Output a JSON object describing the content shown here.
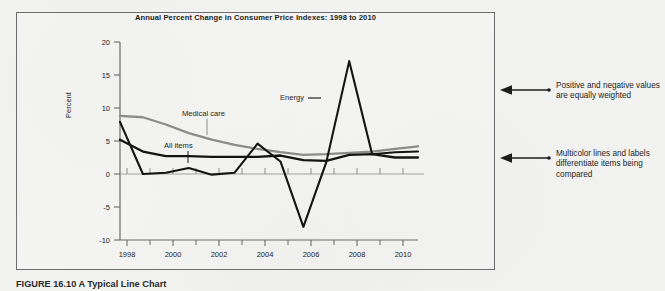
{
  "figure": {
    "caption": "FIGURE 16.10  A Typical Line Chart",
    "box_border_color": "#6e6e72",
    "background_color": "#f2f2f0"
  },
  "chart_title": "Annual Percent Change in Consumer Price Indexes: 1998 to 2010",
  "axis": {
    "y_title": "Percent",
    "y_ticks": [
      "20",
      "15",
      "10",
      "5",
      "0",
      "-5",
      "-10"
    ],
    "y_min": -10,
    "y_max": 20,
    "x_ticks": [
      "1998",
      "2000",
      "2002",
      "2004",
      "2006",
      "2008",
      "2010"
    ],
    "x_min": 1998,
    "x_max": 2011
  },
  "series_labels": {
    "medical_care": "Medical care",
    "all_items": "All items",
    "energy": "Energy"
  },
  "callouts": [
    {
      "text": "Positive and negative values are equally weighted"
    },
    {
      "text": "Multicolor lines and labels differentiate items being compared"
    }
  ],
  "colors": {
    "medical_care": "#8d8d8d",
    "all_items": "#141414",
    "energy": "#141414",
    "axis": "#6b6b6b",
    "zero_line": "#9a9a9a",
    "leader": "#8d8d8d"
  },
  "chart_data": {
    "type": "line",
    "title": "Annual Percent Change in Consumer Price Indexes: 1998 to 2010",
    "xlabel": "",
    "ylabel": "Percent",
    "xlim": [
      1998,
      2011
    ],
    "ylim": [
      -10,
      20
    ],
    "grid": false,
    "legend": "inline-labels",
    "x": [
      1998,
      1999,
      2000,
      2001,
      2002,
      2003,
      2004,
      2005,
      2006,
      2007,
      2008,
      2009,
      2010,
      2011
    ],
    "series": [
      {
        "name": "Medical care",
        "color": "#8d8d8d",
        "values": [
          8.8,
          8.6,
          7.5,
          6.2,
          5.2,
          4.4,
          3.8,
          3.3,
          2.9,
          3.0,
          3.2,
          3.4,
          3.8,
          4.2
        ]
      },
      {
        "name": "All items",
        "color": "#141414",
        "values": [
          5.2,
          3.4,
          2.7,
          2.7,
          2.6,
          2.6,
          2.6,
          2.8,
          2.1,
          2.0,
          2.9,
          3.0,
          2.5,
          2.5
        ]
      },
      {
        "name": "Energy",
        "color": "#141414",
        "values": [
          7.9,
          0.0,
          0.2,
          0.9,
          -0.1,
          0.2,
          4.6,
          1.9,
          -8.0,
          1.8,
          17.1,
          3.0,
          3.3,
          3.4
        ]
      }
    ]
  }
}
